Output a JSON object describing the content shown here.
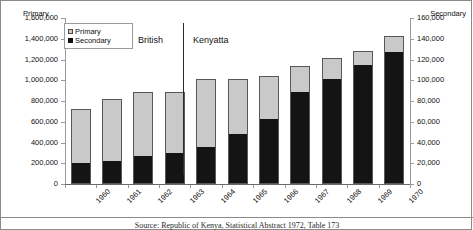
{
  "chart_data": {
    "type": "bar",
    "title": "",
    "subtitle": "",
    "xlabel": "",
    "ylabel": "Primary",
    "y2label": "Secondary",
    "grid": false,
    "legend_position": "top-left",
    "categories": [
      "1960",
      "1961",
      "1962",
      "1963",
      "1964",
      "1965",
      "1966",
      "1967",
      "1968",
      "1969",
      "1970"
    ],
    "ylim": [
      0,
      1600000
    ],
    "y2lim": [
      0,
      160000
    ],
    "yticks": [
      "0",
      "200,000",
      "400,000",
      "600,000",
      "800,000",
      "1,000,000",
      "1,200,000",
      "1,400,000",
      "1,600,000"
    ],
    "ytick_values": [
      0,
      200000,
      400000,
      600000,
      800000,
      1000000,
      1200000,
      1400000,
      1600000
    ],
    "y2ticks": [
      "0",
      "20,000",
      "40,000",
      "60,000",
      "80,000",
      "100,000",
      "120,000",
      "140,000",
      "160,000"
    ],
    "y2tick_values": [
      0,
      20000,
      40000,
      60000,
      80000,
      100000,
      120000,
      140000,
      160000
    ],
    "series": [
      {
        "name": "Primary",
        "axis": "left",
        "color": "#c9c9c9",
        "values": [
          725000,
          815000,
          885000,
          890000,
          1010000,
          1015000,
          1045000,
          1135000,
          1210000,
          1280000,
          1425000
        ]
      },
      {
        "name": "Secondary",
        "axis": "right",
        "color": "#141414",
        "values": [
          20000,
          22000,
          27000,
          30000,
          36000,
          48000,
          63000,
          89000,
          101000,
          115000,
          127000
        ]
      }
    ],
    "annotations": [
      {
        "text": "British",
        "at_category": "1962"
      },
      {
        "text": "Kenyatta",
        "at_category": "1964"
      }
    ]
  },
  "legend": {
    "items": [
      {
        "label": "Primary",
        "marker": "light-gray-square"
      },
      {
        "label": "Secondary",
        "marker": "black-square"
      }
    ]
  },
  "caption": {
    "text": "Source: Republic of Kenya, Statistical Abstract 1972, Table 173"
  }
}
